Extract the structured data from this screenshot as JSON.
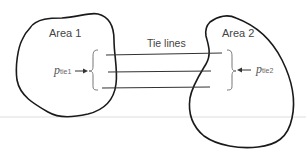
{
  "diagram": {
    "areas": [
      {
        "label": "Area 1"
      },
      {
        "label": "Area 2"
      }
    ],
    "tie_lines": {
      "label": "Tie lines",
      "count": 3
    },
    "power_labels": [
      {
        "symbol": "p",
        "subscript": "tie1"
      },
      {
        "symbol": "p",
        "subscript": "tie2"
      }
    ],
    "colors": {
      "outline": "#1a1a1a",
      "line": "#333333",
      "brace": "#777777",
      "text": "#444444"
    }
  }
}
